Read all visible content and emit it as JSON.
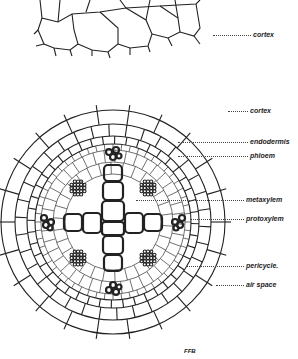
{
  "diagram": {
    "labels": [
      {
        "id": "cortex_top",
        "text": "cortex",
        "x": 253,
        "y": 31
      },
      {
        "id": "cortex",
        "text": "cortex",
        "x": 250,
        "y": 107
      },
      {
        "id": "endodermis",
        "text": "endodermis",
        "x": 250,
        "y": 138
      },
      {
        "id": "phloem",
        "text": "phloem",
        "x": 250,
        "y": 152
      },
      {
        "id": "metaxylem",
        "text": "metaxylem",
        "x": 246,
        "y": 196
      },
      {
        "id": "protoxylem",
        "text": "protoxylem",
        "x": 246,
        "y": 215
      },
      {
        "id": "pericycle",
        "text": "pericycle.",
        "x": 246,
        "y": 262
      },
      {
        "id": "air_space",
        "text": "air space",
        "x": 246,
        "y": 281
      }
    ],
    "signature": "FFB",
    "colors": {
      "ink": "#222222",
      "background": "#ffffff"
    }
  }
}
